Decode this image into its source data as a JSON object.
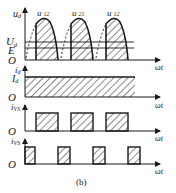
{
  "figure": {
    "caption": "(b)",
    "x_axis_label": "ωt",
    "origin_label": "O"
  },
  "panels": {
    "ud": {
      "y_label": "u",
      "y_label_sub": "d",
      "level_labels": [
        {
          "main": "U",
          "sub": "d"
        },
        {
          "main": "E",
          "sub": ""
        }
      ],
      "curve_labels": [
        {
          "main": "u",
          "sub": "12"
        },
        {
          "main": "u",
          "sub": "21"
        },
        {
          "main": "u",
          "sub": "12"
        }
      ]
    },
    "id": {
      "y_label": "i",
      "y_label_sub": "d",
      "level_label": {
        "main": "I",
        "sub": "d"
      }
    },
    "ivs1": {
      "y_label": "i",
      "y_label_sub": "VS"
    },
    "ivs3": {
      "y_label": "i",
      "y_label_sub": "VS"
    }
  },
  "colors": {
    "ink": "#1a1a1a",
    "background": "#ffffff"
  }
}
